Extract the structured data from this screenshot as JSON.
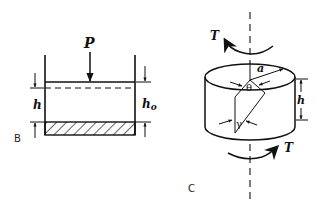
{
  "panels": [
    {
      "id": "B",
      "caption": "B",
      "description": "Piston-cylinder compression: load P applied to piston, specimen height h (deformed) vs h0 (original) above hatched base",
      "labels": {
        "load": "P",
        "height_deformed": "h",
        "height_original": "h",
        "height_original_sub": "o"
      }
    },
    {
      "id": "C",
      "caption": "C",
      "description": "Torsion of cylindrical specimen with torque T about vertical axis; radius a, height h, twist angle theta, shear strain gamma",
      "labels": {
        "torque_top": "T",
        "torque_bottom": "T",
        "radius": "a",
        "twist_angle": "θ",
        "shear_strain": "γ",
        "height": "h"
      }
    }
  ],
  "colors": {
    "ink": "#111111",
    "background": "#ffffff"
  }
}
